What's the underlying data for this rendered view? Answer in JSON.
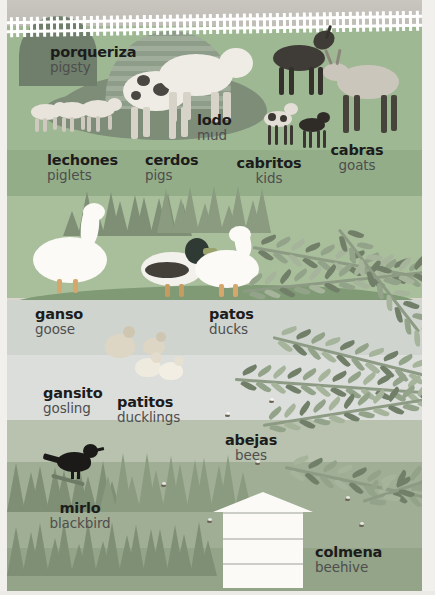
{
  "page": {
    "type": "bilingual-picture-book-page",
    "theme": "farm-animals",
    "background_color": "#b8c2ae",
    "paper_margin_color": "#f2f0ec"
  },
  "palette": {
    "sky": "#c9c6c0",
    "meadow": "#9fb894",
    "bank": "#a9bf9c",
    "pond": "#cfd4cf",
    "lower_meadow": "#9fae95",
    "mud": "#7d8d78",
    "barn": "#8e9c8a",
    "fence": "#ffffff",
    "hive": "#fbfaf7",
    "label_es": "#1c1c1c",
    "label_en": "#4e4e4e"
  },
  "labels": [
    {
      "id": "pigsty",
      "es": "porqueriza",
      "en": "pigsty",
      "x": 43,
      "y": 44,
      "align": "left"
    },
    {
      "id": "mud",
      "es": "lodo",
      "en": "mud",
      "x": 190,
      "y": 112,
      "align": "left"
    },
    {
      "id": "piglets",
      "es": "lechones",
      "en": "piglets",
      "x": 40,
      "y": 152,
      "align": "left"
    },
    {
      "id": "pigs",
      "es": "cerdos",
      "en": "pigs",
      "x": 138,
      "y": 152,
      "align": "left"
    },
    {
      "id": "kids",
      "es": "cabritos",
      "en": "kids",
      "x": 262,
      "y": 155,
      "align": "center"
    },
    {
      "id": "goats",
      "es": "cabras",
      "en": "goats",
      "x": 350,
      "y": 142,
      "align": "center"
    },
    {
      "id": "goose",
      "es": "ganso",
      "en": "goose",
      "x": 28,
      "y": 306,
      "align": "left"
    },
    {
      "id": "ducks",
      "es": "patos",
      "en": "ducks",
      "x": 202,
      "y": 306,
      "align": "left"
    },
    {
      "id": "gosling",
      "es": "gansito",
      "en": "gosling",
      "x": 36,
      "y": 385,
      "align": "left"
    },
    {
      "id": "ducklings",
      "es": "patitos",
      "en": "ducklings",
      "x": 110,
      "y": 394,
      "align": "left"
    },
    {
      "id": "bees",
      "es": "abejas",
      "en": "bees",
      "x": 244,
      "y": 432,
      "align": "center"
    },
    {
      "id": "blackbird",
      "es": "mirlo",
      "en": "blackbird",
      "x": 73,
      "y": 500,
      "align": "center"
    },
    {
      "id": "beehive",
      "es": "colmena",
      "en": "beehive",
      "x": 308,
      "y": 544,
      "align": "left"
    }
  ],
  "scene_objects": {
    "fence_label": "white-picket-fence",
    "barn_label": "corrugated-arch-pigsty",
    "mud_label": "mud-puddle",
    "hive_label": "white-langstroth-beehive",
    "pond_label": "pond-water",
    "fern_label": "fern-fronds",
    "bush_label": "spiky-bushes"
  },
  "animals": [
    {
      "name": "piglet",
      "count": 3
    },
    {
      "name": "pig",
      "count": 2
    },
    {
      "name": "goat-dark",
      "count": 1
    },
    {
      "name": "goat-light",
      "count": 1
    },
    {
      "name": "kid",
      "count": 2
    },
    {
      "name": "goose",
      "count": 1
    },
    {
      "name": "duck-male",
      "count": 1
    },
    {
      "name": "duck-female",
      "count": 1
    },
    {
      "name": "gosling",
      "count": 1
    },
    {
      "name": "duckling",
      "count": 3
    },
    {
      "name": "blackbird",
      "count": 1
    },
    {
      "name": "bee",
      "count": 7
    }
  ]
}
